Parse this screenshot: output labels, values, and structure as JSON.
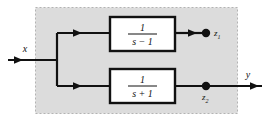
{
  "figure": {
    "type": "block-diagram",
    "plant_region": {
      "name": "shaded-plant-region",
      "fill_color": "#dcdcdc",
      "border_style": "dashed",
      "border_color": "#b0b0b0"
    },
    "signals": {
      "input": "x",
      "output": "y",
      "internal_upper": "z",
      "internal_upper_sub": "1",
      "internal_lower": "z",
      "internal_lower_sub": "2"
    },
    "blocks": [
      {
        "name": "transfer-function-block-upper",
        "numerator": "1",
        "denominator": "s − 1",
        "expression": "1/(s - 1)",
        "border_color": "#111111",
        "fill_color": "#ffffff"
      },
      {
        "name": "transfer-function-block-lower",
        "numerator": "1",
        "denominator": "s + 1",
        "expression": "1/(s + 1)",
        "border_color": "#111111",
        "fill_color": "#ffffff"
      }
    ],
    "nodes": [
      {
        "name": "branch-point",
        "label": ""
      },
      {
        "name": "node-z1",
        "label": "z1"
      },
      {
        "name": "node-z2",
        "label": "z2"
      }
    ],
    "line_color": "#111111"
  }
}
